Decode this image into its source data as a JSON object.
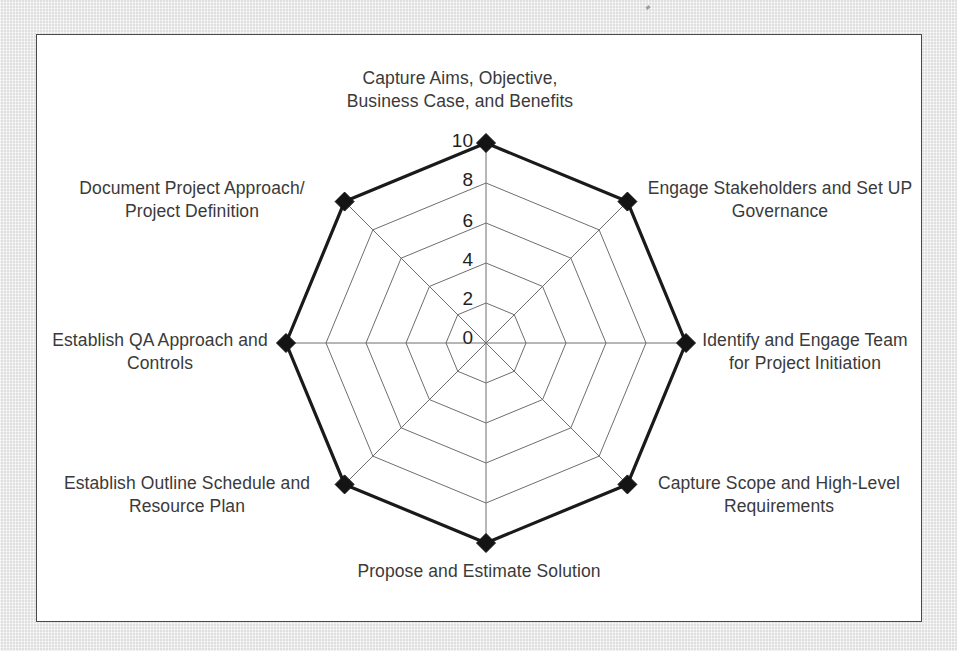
{
  "chart_data": {
    "type": "radar",
    "title": "",
    "subtitle": "",
    "xlabel": "",
    "ylabel": "",
    "grid": true,
    "legend": "none",
    "axis_min": 0,
    "axis_max": 10,
    "tick_step": 2,
    "tick_labels": [
      "0",
      "2",
      "4",
      "6",
      "8",
      "10"
    ],
    "tick_values": [
      0,
      2,
      4,
      6,
      8,
      10
    ],
    "ring_count": 5,
    "axis_count": 8,
    "categories": [
      "Capture Aims, Objective,\nBusiness Case, and Benefits",
      "Engage Stakeholders and Set UP\nGovernance",
      "Identify and Engage Team\nfor Project Initiation",
      "Capture Scope and High-Level\nRequirements",
      "Propose and Estimate Solution",
      "Establish Outline Schedule and\nResource Plan",
      "Establish QA Approach and\nControls",
      "Document Project Approach/\nProject Definition"
    ],
    "series": [
      {
        "name": "Project Initiation Maturity",
        "values": [
          10,
          10,
          10,
          10,
          10,
          10,
          10,
          10
        ],
        "marker": "diamond",
        "line_color": "#1a1a1a",
        "line_width": 3.2,
        "fill": "none"
      }
    ],
    "colors": {
      "grid_line": "#6e6e6e",
      "axis_spoke": "#6e6e6e",
      "series_line": "#1a1a1a",
      "marker_fill": "#141414",
      "panel_background": "#ffffff",
      "panel_border": "#4a4a4a",
      "page_background": "#e8e8e8",
      "label_text": "#3a3a3a",
      "tick_text": "#1f1f1f"
    }
  },
  "panel": {
    "title": ""
  }
}
